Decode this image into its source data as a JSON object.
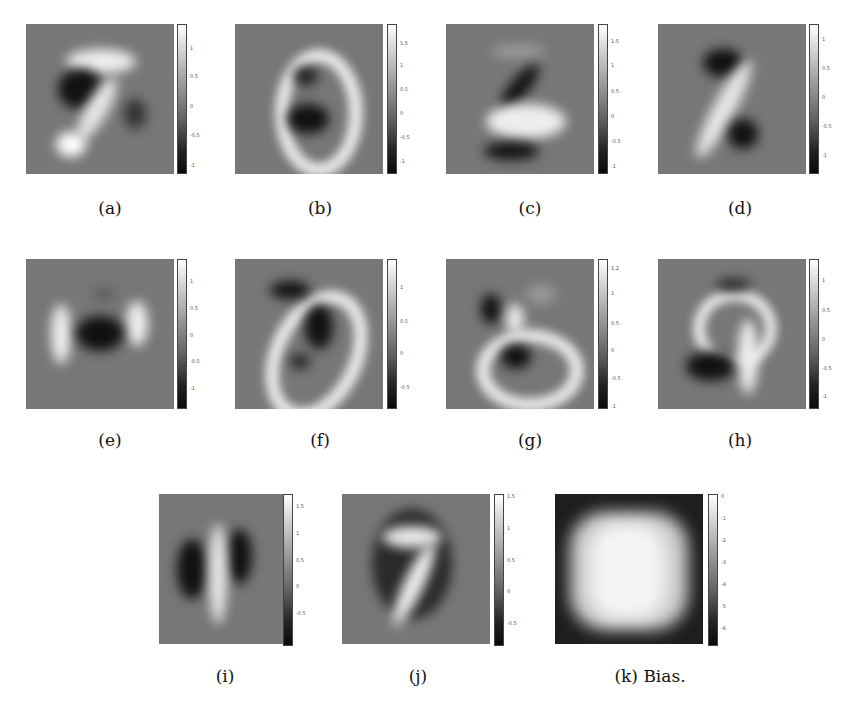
{
  "figure": {
    "panels": [
      {
        "id": "a",
        "caption": "(a)",
        "ticks": [
          "1",
          "0.5",
          "0",
          "-0.5",
          "-1"
        ]
      },
      {
        "id": "b",
        "caption": "(b)",
        "ticks": [
          "1.5",
          "1",
          "0.5",
          "0",
          "-0.5",
          "-1"
        ]
      },
      {
        "id": "c",
        "caption": "(c)",
        "ticks": [
          "1.5",
          "1",
          "0.5",
          "0",
          "-0.5",
          "-1"
        ]
      },
      {
        "id": "d",
        "caption": "(d)",
        "ticks": [
          "1",
          "0.5",
          "0",
          "-0.5",
          "-1"
        ]
      },
      {
        "id": "e",
        "caption": "(e)",
        "ticks": [
          "1",
          "0.5",
          "0",
          "-0.5",
          "-1"
        ]
      },
      {
        "id": "f",
        "caption": "(f)",
        "ticks": [
          "1",
          "0.5",
          "0",
          "-0.5"
        ]
      },
      {
        "id": "g",
        "caption": "(g)",
        "ticks": [
          "1.2",
          "1",
          "0.5",
          "0",
          "-0.5",
          "-1"
        ]
      },
      {
        "id": "h",
        "caption": "(h)",
        "ticks": [
          "1",
          "0.5",
          "0",
          "-0.5",
          "-1"
        ]
      },
      {
        "id": "i",
        "caption": "(i)",
        "ticks": [
          "1.5",
          "1",
          "0.5",
          "0",
          "-0.5",
          "-1"
        ]
      },
      {
        "id": "j",
        "caption": "(j)",
        "ticks": [
          "1.5",
          "1",
          "0.5",
          "0",
          "-0.5"
        ]
      },
      {
        "id": "k",
        "caption": "(k) Bias.",
        "ticks": [
          "0",
          "-1",
          "-2",
          "-3",
          "-4",
          "-5",
          "-6"
        ]
      }
    ],
    "colormap": "grayscale",
    "colors": {
      "background": "#777777",
      "bias_background": "#1e1e1e"
    }
  }
}
